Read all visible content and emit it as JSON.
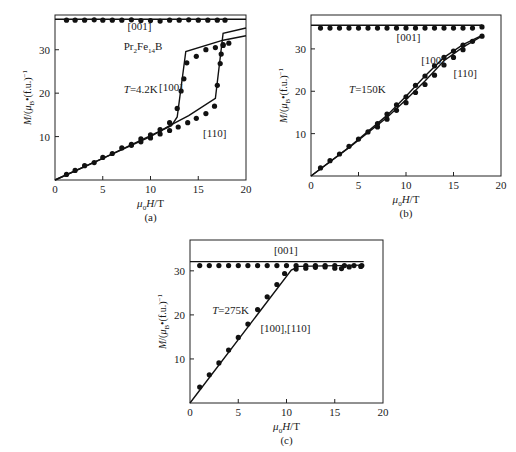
{
  "figure": {
    "panels": [
      "(a)",
      "(b)",
      "(c)"
    ]
  },
  "chart_data": [
    {
      "id": "a",
      "type": "scatter",
      "caption": "(a)",
      "title": "",
      "xlabel": "μ0H/T",
      "ylabel": "M/(μB·(f.u.)⁻¹)",
      "xlim": [
        0,
        20
      ],
      "ylim": [
        0,
        38
      ],
      "xticks": [
        0,
        5,
        10,
        15,
        20
      ],
      "yticks": [
        10,
        20,
        30
      ],
      "annotations": [
        {
          "text": "Pr2Fe14B",
          "x": 7.2,
          "y": 30
        },
        {
          "text": "T=4.2K",
          "x": 7.2,
          "y": 20
        },
        {
          "text": "[001]",
          "x": 7.6,
          "y": 34.5
        },
        {
          "text": "[100]",
          "x": 10.9,
          "y": 20.5
        },
        {
          "text": "[110]",
          "x": 15.5,
          "y": 10
        }
      ],
      "pixel_box": {
        "x0": 55,
        "y0": 180,
        "x1": 246,
        "y1": 15
      },
      "series": [
        {
          "name": "[001] calc",
          "kind": "line",
          "points": [
            [
              0,
              37
            ],
            [
              20,
              37
            ]
          ]
        },
        {
          "name": "[001] exp",
          "kind": "points",
          "points": [
            [
              1.2,
              36.8
            ],
            [
              2.1,
              36.8
            ],
            [
              3.1,
              36.8
            ],
            [
              4.1,
              36.9
            ],
            [
              5.0,
              36.8
            ],
            [
              6.0,
              36.8
            ],
            [
              7.0,
              36.8
            ],
            [
              8.0,
              36.9
            ],
            [
              9.0,
              36.7
            ],
            [
              10.0,
              36.7
            ],
            [
              11.0,
              36.6
            ],
            [
              12.0,
              36.8
            ],
            [
              13.0,
              36.8
            ],
            [
              14.0,
              36.9
            ],
            [
              15.0,
              36.8
            ],
            [
              16.0,
              36.8
            ],
            [
              17.0,
              36.8
            ],
            [
              17.8,
              36.8
            ]
          ]
        },
        {
          "name": "[100] calc",
          "kind": "line",
          "points": [
            [
              0,
              0
            ],
            [
              5,
              5
            ],
            [
              10,
              10.2
            ],
            [
              12.2,
              12.5
            ],
            [
              12.8,
              14.5
            ],
            [
              13.7,
              29.6
            ],
            [
              17.6,
              32.2
            ],
            [
              20,
              33.2
            ]
          ]
        },
        {
          "name": "[110] calc",
          "kind": "line",
          "points": [
            [
              0,
              0
            ],
            [
              5,
              5
            ],
            [
              10,
              10
            ],
            [
              12,
              12.5
            ],
            [
              14,
              14.8
            ],
            [
              16.8,
              18.8
            ],
            [
              17.6,
              33.8
            ],
            [
              20,
              35
            ]
          ]
        },
        {
          "name": "[100] exp",
          "kind": "points",
          "points": [
            [
              1.2,
              1.3
            ],
            [
              2.1,
              2.2
            ],
            [
              3.1,
              3.3
            ],
            [
              4.1,
              4.0
            ],
            [
              5.0,
              5.2
            ],
            [
              6.0,
              6.1
            ],
            [
              7.0,
              7.4
            ],
            [
              8.0,
              8.2
            ],
            [
              9.0,
              9.5
            ],
            [
              10.0,
              10.4
            ],
            [
              11.0,
              11.6
            ],
            [
              12.0,
              13.2
            ],
            [
              12.8,
              16.5
            ],
            [
              13.2,
              20.5
            ],
            [
              13.5,
              23.3
            ],
            [
              13.8,
              27.0
            ],
            [
              14.8,
              28.5
            ],
            [
              15.8,
              30.0
            ],
            [
              16.8,
              30.5
            ],
            [
              17.6,
              31.2
            ],
            [
              18.2,
              31.5
            ]
          ]
        },
        {
          "name": "[110] exp",
          "kind": "points",
          "points": [
            [
              8.0,
              8.0
            ],
            [
              9.0,
              8.8
            ],
            [
              10.0,
              9.7
            ],
            [
              11.0,
              10.6
            ],
            [
              12.0,
              11.4
            ],
            [
              12.9,
              12.2
            ],
            [
              13.9,
              13.2
            ],
            [
              14.8,
              14.2
            ],
            [
              15.8,
              15.3
            ],
            [
              16.7,
              17.0
            ],
            [
              17.0,
              21.8
            ],
            [
              17.3,
              26.8
            ],
            [
              17.4,
              29.0
            ],
            [
              17.6,
              31.0
            ]
          ]
        }
      ]
    },
    {
      "id": "b",
      "type": "scatter",
      "caption": "(b)",
      "title": "",
      "xlabel": "μ0H/T",
      "ylabel": "M/(μB·(f.u.)⁻¹)",
      "xlim": [
        0,
        20
      ],
      "ylim": [
        0,
        38
      ],
      "xticks": [
        0,
        5,
        10,
        15,
        20
      ],
      "yticks": [
        10,
        20,
        30
      ],
      "annotations": [
        {
          "text": "T=150K",
          "x": 4.0,
          "y": 19.6
        },
        {
          "text": "[001]",
          "x": 9.0,
          "y": 31.8
        },
        {
          "text": "[100]",
          "x": 11.6,
          "y": 26.5
        },
        {
          "text": "[110]",
          "x": 15.0,
          "y": 23.3
        }
      ],
      "pixel_box": {
        "x0": 311,
        "y0": 176,
        "x1": 501,
        "y1": 15
      },
      "series": [
        {
          "name": "[001] calc",
          "kind": "line",
          "points": [
            [
              0,
              35.6
            ],
            [
              18,
              35.6
            ]
          ]
        },
        {
          "name": "[001] exp",
          "kind": "points",
          "points": [
            [
              1,
              34.9
            ],
            [
              2,
              34.9
            ],
            [
              3,
              34.9
            ],
            [
              4,
              34.9
            ],
            [
              5,
              34.9
            ],
            [
              6,
              34.9
            ],
            [
              7,
              34.9
            ],
            [
              8,
              34.9
            ],
            [
              9,
              34.9
            ],
            [
              10,
              34.9
            ],
            [
              11,
              34.9
            ],
            [
              12,
              34.9
            ],
            [
              13,
              34.9
            ],
            [
              14,
              34.9
            ],
            [
              15,
              34.9
            ],
            [
              16,
              34.9
            ],
            [
              17,
              34.9
            ],
            [
              18,
              35.2
            ]
          ]
        },
        {
          "name": "[100] calc",
          "kind": "line",
          "points": [
            [
              0,
              0
            ],
            [
              4,
              6.8
            ],
            [
              8,
              14.3
            ],
            [
              10,
              18.8
            ],
            [
              12,
              23.6
            ],
            [
              14,
              28.0
            ],
            [
              16,
              31.0
            ],
            [
              18,
              33.2
            ]
          ]
        },
        {
          "name": "[110] calc",
          "kind": "line",
          "points": [
            [
              0,
              0
            ],
            [
              4,
              6.7
            ],
            [
              8,
              13.8
            ],
            [
              10,
              18.0
            ],
            [
              12,
              22.4
            ],
            [
              14,
              27.2
            ],
            [
              16,
              30.4
            ],
            [
              18,
              33.0
            ]
          ]
        },
        {
          "name": "[100] exp",
          "kind": "points",
          "points": [
            [
              1,
              1.9
            ],
            [
              2,
              3.6
            ],
            [
              3,
              5.2
            ],
            [
              4,
              7.0
            ],
            [
              5,
              8.7
            ],
            [
              6,
              10.4
            ],
            [
              7,
              12.4
            ],
            [
              8,
              14.6
            ],
            [
              9,
              16.8
            ],
            [
              10,
              18.7
            ],
            [
              11,
              21.4
            ],
            [
              12,
              23.6
            ],
            [
              13,
              26.0
            ],
            [
              14,
              28.0
            ],
            [
              15,
              29.5
            ],
            [
              16,
              30.9
            ],
            [
              17,
              31.8
            ],
            [
              18,
              33.0
            ]
          ]
        },
        {
          "name": "[110] exp",
          "kind": "points",
          "points": [
            [
              7,
              11.6
            ],
            [
              8,
              13.4
            ],
            [
              9,
              15.5
            ],
            [
              10,
              17.3
            ],
            [
              11,
              19.7
            ],
            [
              12,
              21.6
            ],
            [
              13,
              23.8
            ],
            [
              14,
              26.2
            ],
            [
              15,
              28.0
            ],
            [
              16,
              29.8
            ]
          ]
        }
      ]
    },
    {
      "id": "c",
      "type": "scatter",
      "caption": "(c)",
      "title": "",
      "xlabel": "μ0H/T",
      "ylabel": "M/(μB·(f.u.)⁻¹)",
      "xlim": [
        0,
        20
      ],
      "ylim": [
        0,
        37
      ],
      "xticks": [
        0,
        5,
        10,
        15,
        20
      ],
      "yticks": [
        10,
        20,
        30
      ],
      "annotations": [
        {
          "text": "T=275K",
          "x": 2.3,
          "y": 20.3
        },
        {
          "text": "[001]",
          "x": 8.7,
          "y": 33.8
        },
        {
          "text": "[100],[110]",
          "x": 7.3,
          "y": 16.2
        }
      ],
      "pixel_box": {
        "x0": 190,
        "y0": 403,
        "x1": 383,
        "y1": 240
      },
      "series": [
        {
          "name": "[001] calc",
          "kind": "line",
          "points": [
            [
              0,
              32.1
            ],
            [
              18,
              32.1
            ]
          ]
        },
        {
          "name": "[100],[110] calc",
          "kind": "line",
          "points": [
            [
              0,
              0
            ],
            [
              10.5,
              30.2
            ],
            [
              11.3,
              31.0
            ],
            [
              18,
              31.3
            ]
          ]
        },
        {
          "name": "[001] exp",
          "kind": "points",
          "points": [
            [
              1,
              31.2
            ],
            [
              2,
              31.2
            ],
            [
              3,
              31.2
            ],
            [
              4,
              31.2
            ],
            [
              5,
              31.2
            ],
            [
              6,
              31.2
            ],
            [
              7,
              31.2
            ],
            [
              8,
              31.2
            ],
            [
              9,
              31.2
            ],
            [
              10,
              31.2
            ],
            [
              11,
              31.2
            ],
            [
              12,
              31.2
            ],
            [
              13,
              31.2
            ],
            [
              14,
              31.2
            ],
            [
              15,
              31.2
            ],
            [
              16,
              31.2
            ],
            [
              17,
              31.2
            ],
            [
              17.8,
              31.2
            ]
          ]
        },
        {
          "name": "[100],[110] exp",
          "kind": "points",
          "points": [
            [
              1,
              3.6
            ],
            [
              2,
              6.4
            ],
            [
              3,
              9.1
            ],
            [
              4,
              12.0
            ],
            [
              5,
              14.9
            ],
            [
              6,
              17.9
            ],
            [
              7,
              21.2
            ],
            [
              8,
              24.1
            ],
            [
              9,
              26.9
            ],
            [
              9.8,
              29.4
            ],
            [
              11,
              30.4
            ],
            [
              12,
              30.6
            ],
            [
              13,
              30.8
            ],
            [
              14,
              30.9
            ],
            [
              15,
              30.6
            ],
            [
              15.7,
              30.5
            ],
            [
              16.5,
              30.9
            ],
            [
              17.7,
              31.0
            ]
          ]
        }
      ]
    }
  ]
}
